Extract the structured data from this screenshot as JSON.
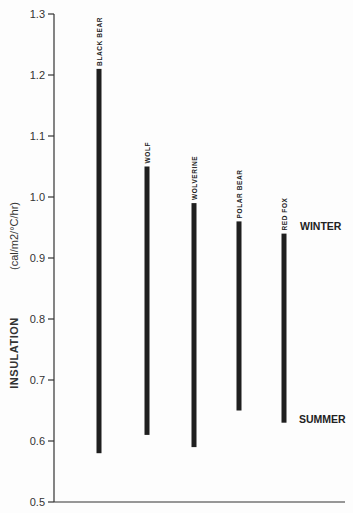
{
  "chart_data": {
    "type": "range-bar",
    "title": "",
    "ylabel": "INSULATION",
    "ylabel_units": "(cal/m2/°C/hr)",
    "xlabel": "",
    "ylim": [
      0.5,
      1.3
    ],
    "yticks": [
      "1.3",
      "1.2",
      "1.1",
      "1.0",
      "0.9",
      "0.8",
      "0.7",
      "0.6",
      "0.5"
    ],
    "grid": false,
    "categories": [
      "BLACK BEAR",
      "WOLF",
      "WOLVERINE",
      "POLAR BEAR",
      "RED FOX"
    ],
    "series": [
      {
        "name": "WINTER",
        "values": [
          1.21,
          1.05,
          0.99,
          0.96,
          0.94
        ]
      },
      {
        "name": "SUMMER",
        "values": [
          0.58,
          0.61,
          0.59,
          0.65,
          0.63
        ]
      }
    ],
    "annotations": [
      {
        "text": "WINTER",
        "anchor": "top of range bars"
      },
      {
        "text": "SUMMER",
        "anchor": "bottom of range bars"
      }
    ],
    "colors": {
      "bar": "#1f1f1f",
      "axis": "#333333",
      "text": "#333333"
    }
  }
}
